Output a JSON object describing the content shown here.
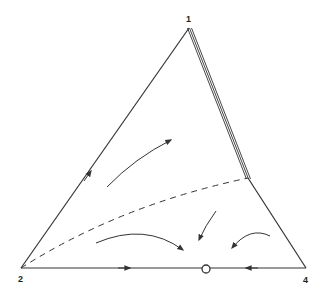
{
  "diagram": {
    "type": "ternary-phase-portrait",
    "vertices": [
      {
        "id": "v1",
        "label": "1",
        "x": 189,
        "y": 28
      },
      {
        "id": "v2",
        "label": "2",
        "x": 21,
        "y": 268
      },
      {
        "id": "v4",
        "label": "4",
        "x": 306,
        "y": 268
      }
    ],
    "stroke_color": "#333333",
    "fixed_point": {
      "label": "open-circle",
      "x": 206,
      "y": 269
    },
    "separatrix": {
      "style": "dashed",
      "from": "2",
      "to_point": [
        248,
        178
      ]
    },
    "triple_edge": {
      "from": "1",
      "to_point": [
        248,
        178
      ]
    }
  }
}
